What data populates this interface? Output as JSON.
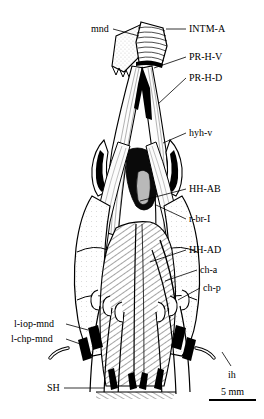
{
  "figure": {
    "type": "anatomical-illustration",
    "view": "ventral view of head and branchial musculature",
    "background_color": "#ffffff",
    "ink_color": "#000000"
  },
  "labels": [
    {
      "id": "mnd",
      "text": "mnd",
      "side": "left",
      "x": 91,
      "y": 24,
      "leader": [
        [
          113,
          29
        ],
        [
          139,
          36
        ]
      ]
    },
    {
      "id": "intm-a",
      "text": "INTM-A",
      "side": "right",
      "x": 189,
      "y": 24,
      "leader": [
        [
          186,
          29
        ],
        [
          166,
          29
        ]
      ]
    },
    {
      "id": "pr-h-v",
      "text": "PR-H-V",
      "side": "right",
      "x": 189,
      "y": 52,
      "leader": [
        [
          186,
          57
        ],
        [
          154,
          68
        ]
      ]
    },
    {
      "id": "pr-h-d",
      "text": "PR-H-D",
      "side": "right",
      "x": 189,
      "y": 73,
      "leader": [
        [
          186,
          78
        ],
        [
          158,
          104
        ]
      ]
    },
    {
      "id": "hyh-v",
      "text": "hyh-v",
      "side": "right",
      "x": 189,
      "y": 128,
      "leader": [
        [
          186,
          133
        ],
        [
          163,
          143
        ]
      ]
    },
    {
      "id": "hh-ab",
      "text": "HH-AB",
      "side": "right",
      "x": 189,
      "y": 184,
      "leader": [
        [
          186,
          189
        ],
        [
          140,
          201
        ]
      ]
    },
    {
      "id": "r-br-i",
      "text": "r-br-I",
      "side": "right",
      "x": 189,
      "y": 214,
      "leader": [
        [
          186,
          219
        ],
        [
          156,
          205
        ]
      ]
    },
    {
      "id": "hh-ad",
      "text": "HH-AD",
      "side": "right",
      "x": 189,
      "y": 245,
      "leader": [
        [
          186,
          250
        ],
        [
          150,
          262
        ]
      ]
    },
    {
      "id": "ch-a",
      "text": "ch-a",
      "side": "right",
      "x": 200,
      "y": 265,
      "leader": [
        [
          197,
          270
        ],
        [
          165,
          281
        ]
      ]
    },
    {
      "id": "ch-p",
      "text": "ch-p",
      "side": "right",
      "x": 203,
      "y": 283,
      "leader": [
        [
          200,
          288
        ],
        [
          178,
          300
        ]
      ]
    },
    {
      "id": "l-iop-mnd",
      "text": "l-iop-mnd",
      "side": "left",
      "x": 14,
      "y": 319,
      "leader": [
        [
          66,
          324
        ],
        [
          88,
          330
        ]
      ]
    },
    {
      "id": "l-chp-mnd",
      "text": "l-chp-mnd",
      "side": "left",
      "x": 11,
      "y": 334,
      "leader": [
        [
          66,
          339
        ],
        [
          86,
          346
        ]
      ]
    },
    {
      "id": "sh",
      "text": "SH",
      "side": "left",
      "x": 47,
      "y": 383,
      "leader": [
        [
          64,
          388
        ],
        [
          104,
          388
        ]
      ]
    },
    {
      "id": "ih",
      "text": "ih",
      "side": "right",
      "x": 228,
      "y": 370,
      "leader": [
        [
          231,
          366
        ],
        [
          222,
          352
        ]
      ]
    }
  ],
  "scalebar": {
    "text": "5 mm",
    "text_x": 221,
    "text_y": 386,
    "bar_x1": 209,
    "bar_x2": 256,
    "bar_y": 400,
    "bar_thickness": 2
  }
}
